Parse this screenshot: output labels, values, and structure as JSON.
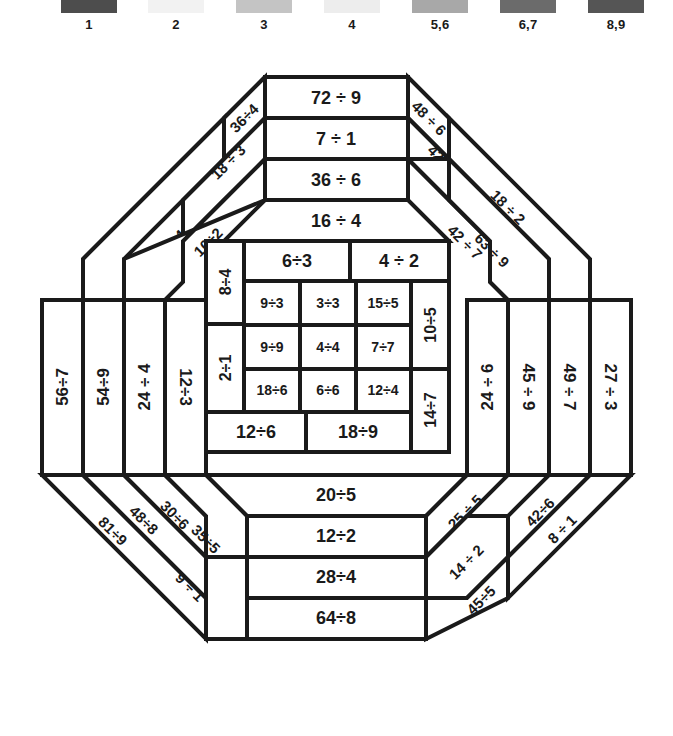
{
  "legend": {
    "items": [
      {
        "label": "1",
        "color": "#4d4d4d",
        "swatch_name": "legend-swatch-1"
      },
      {
        "label": "2",
        "color": "#f2f2f2",
        "swatch_name": "legend-swatch-2"
      },
      {
        "label": "3",
        "color": "#c4c4c4",
        "swatch_name": "legend-swatch-3"
      },
      {
        "label": "4",
        "color": "#ededed",
        "swatch_name": "legend-swatch-4"
      },
      {
        "label": "5,6",
        "color": "#a8a8a8",
        "swatch_name": "legend-swatch-5-6"
      },
      {
        "label": "6,7",
        "color": "#6b6b6b",
        "swatch_name": "legend-swatch-6-7"
      },
      {
        "label": "8,9",
        "color": "#555555",
        "swatch_name": "legend-swatch-8-9"
      }
    ]
  },
  "puzzle": {
    "top_rows": [
      "72 ÷ 9",
      "7 ÷ 1",
      "36 ÷ 6",
      "16 ÷ 4"
    ],
    "bottom_rows": [
      "20÷5",
      "12÷2",
      "28÷4",
      "64÷8"
    ],
    "top_left_diagonals": [
      "40÷5",
      "24 ÷ 4",
      "36÷4",
      "18 ÷ 3",
      "10÷2"
    ],
    "top_right_diagonals": [
      "48 ÷ 6",
      "42 ÷ 7",
      "42 ÷ 7",
      "18 ÷ 2",
      "63 ÷ 9"
    ],
    "bottom_left_diagonals": [
      "81÷9",
      "48÷8",
      "30÷6",
      "35÷5",
      "9 ÷ 1"
    ],
    "bottom_right_diagonals": [
      "25 ÷ 5",
      "42÷6",
      "14 ÷ 2",
      "8 ÷ 1",
      "45÷5"
    ],
    "left_columns": [
      "56÷7",
      "54÷9",
      "24 ÷ 4",
      "12÷3"
    ],
    "right_columns": [
      "24 ÷ 6",
      "45 ÷ 9",
      "49 ÷ 7",
      "27 ÷ 3"
    ],
    "center": {
      "top_band": [
        "6÷3",
        "4 ÷ 2"
      ],
      "bottom_band": [
        "12÷6",
        "18÷9"
      ],
      "left_band": [
        "8÷4",
        "2÷1"
      ],
      "right_band": [
        "10÷5",
        "14÷7"
      ],
      "inner_grid": [
        [
          "9÷3",
          "3÷3",
          "15÷5"
        ],
        [
          "9÷9",
          "4÷4",
          "7÷7"
        ],
        [
          "18÷6",
          "6÷6",
          "12÷4"
        ]
      ]
    }
  }
}
